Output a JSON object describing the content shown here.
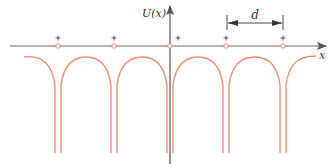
{
  "diagram": {
    "type": "periodic-potential",
    "axis_labels": {
      "y": "U(x)",
      "x": "x"
    },
    "spacing_label": "d",
    "ion_charge_symbol": "+",
    "ion_count": 5,
    "colors": {
      "axis": "#6b6b6b",
      "potential_curve": "#f08a6c",
      "ion_marker": "#f08a6c",
      "text": "#333333"
    }
  }
}
